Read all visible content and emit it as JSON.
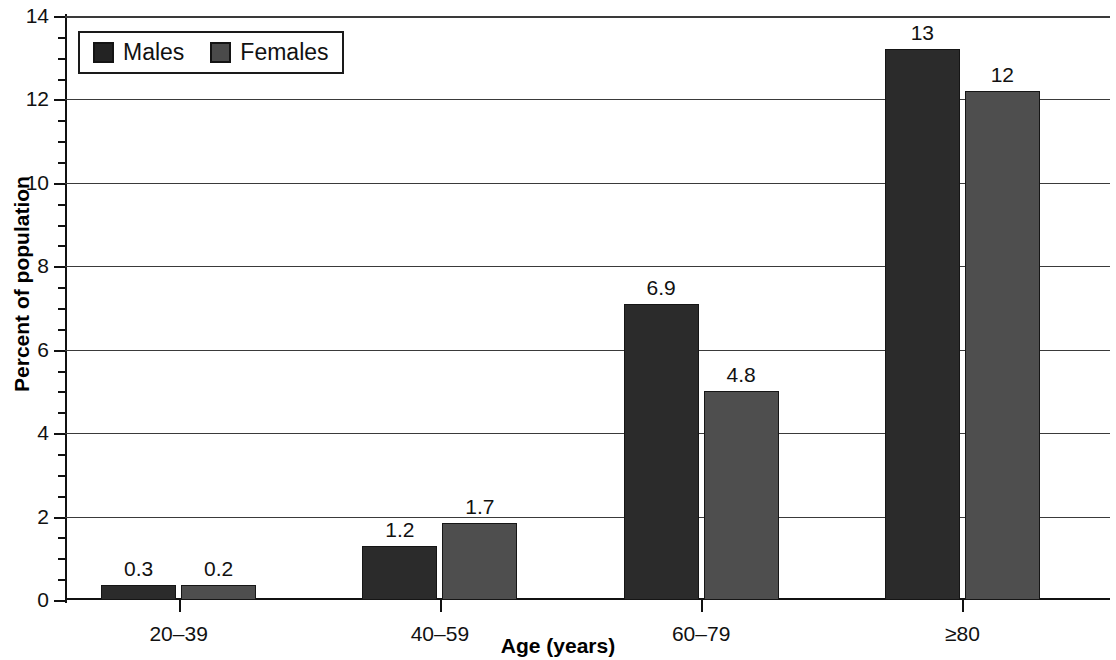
{
  "chart_data": {
    "type": "bar",
    "title": "",
    "xlabel": "Age (years)",
    "ylabel": "Percent of population",
    "categories": [
      "20–39",
      "40–59",
      "60–79",
      "≥80"
    ],
    "series": [
      {
        "name": "Males",
        "color": "#2b2b2b",
        "values": [
          0.3,
          1.2,
          6.9,
          13
        ],
        "labels": [
          "0.3",
          "1.2",
          "6.9",
          "13"
        ],
        "plotted_heights": [
          0.35,
          1.3,
          7.1,
          13.2
        ]
      },
      {
        "name": "Females",
        "color": "#4e4e4e",
        "values": [
          0.2,
          1.7,
          4.8,
          12
        ],
        "labels": [
          "0.2",
          "1.7",
          "4.8",
          "12"
        ],
        "plotted_heights": [
          0.35,
          1.85,
          5.0,
          12.2
        ]
      }
    ],
    "ylim": [
      0,
      14
    ],
    "ytick_values": [
      0,
      2,
      4,
      6,
      8,
      10,
      12,
      14
    ],
    "ytick_labels": [
      "0",
      "2",
      "4",
      "6",
      "8",
      "10",
      "12",
      "14"
    ],
    "yminor_step": 0.5,
    "grid": true,
    "grid_axis": "y",
    "legend_position": "top-left",
    "legend_entries": [
      "Males",
      "Females"
    ]
  },
  "legend": {
    "males_label": "Males",
    "females_label": "Females"
  },
  "axes": {
    "x_title": "Age (years)",
    "y_title": "Percent of population"
  }
}
